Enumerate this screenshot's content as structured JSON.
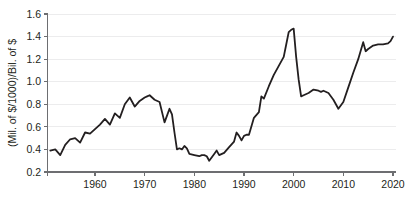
{
  "chart_data": {
    "type": "line",
    "title": "",
    "xlabel": "",
    "ylabel": "(Mil. of $/1000)/Bil. of $",
    "xlim": [
      1951,
      2020
    ],
    "ylim": [
      0.2,
      1.6
    ],
    "grid": true,
    "legend": false,
    "line_color": "#231f20",
    "background_color": "#ffffff",
    "gridline_color": "#ececed",
    "axis_color": "#6d6e71",
    "xticks": [
      "1960",
      "1970",
      "1980",
      "1990",
      "2000",
      "2010",
      "2020"
    ],
    "xtick_values": [
      1960,
      1970,
      1980,
      1990,
      2000,
      2010,
      2020
    ],
    "yticks": [
      "0.2",
      "0.4",
      "0.6",
      "0.8",
      "1.0",
      "1.2",
      "1.4",
      "1.6"
    ],
    "ytick_values": [
      0.2,
      0.4,
      0.6,
      0.8,
      1.0,
      1.2,
      1.4,
      1.6
    ],
    "x": [
      1951,
      1952,
      1953,
      1954,
      1955,
      1956,
      1957,
      1958,
      1959,
      1960,
      1961,
      1962,
      1963,
      1964,
      1965,
      1966,
      1967,
      1968,
      1969,
      1970,
      1971,
      1972,
      1973,
      1974,
      1975,
      1976,
      1977,
      1978,
      1979,
      1980,
      1981,
      1982,
      1983,
      1984,
      1985,
      1986,
      1987,
      1988,
      1989,
      1990,
      1991,
      1992,
      1993,
      1994,
      1995,
      1996,
      1997,
      1998,
      1999,
      2000,
      2001,
      2002,
      2003,
      2004,
      2005,
      2006,
      2007,
      2008,
      2009,
      2010,
      2011,
      2012,
      2013,
      2014,
      2015,
      2016,
      2017,
      2018,
      2019,
      2020
    ],
    "values": [
      0.39,
      0.4,
      0.35,
      0.44,
      0.49,
      0.5,
      0.46,
      0.55,
      0.54,
      0.58,
      0.62,
      0.67,
      0.62,
      0.72,
      0.68,
      0.8,
      0.86,
      0.78,
      0.83,
      0.86,
      0.87,
      0.88,
      0.84,
      0.82,
      0.64,
      0.7,
      0.76,
      0.71,
      0.55,
      0.4,
      0.41,
      0.4,
      0.43,
      0.41,
      0.36,
      0.35,
      0.34,
      0.35,
      0.35,
      0.34,
      0.3,
      0.36,
      0.39,
      0.35,
      0.37,
      0.42,
      0.47,
      0.55,
      0.52,
      0.48,
      0.52,
      0.53,
      0.53,
      0.68,
      0.73,
      0.87,
      0.85,
      0.96,
      1.06,
      1.14,
      1.22,
      1.33,
      1.44,
      1.46,
      1.47,
      1.22,
      1.02,
      0.87,
      0.88,
      0.9
    ],
    "values_tail": [
      0.93,
      0.92,
      0.91,
      0.92,
      0.9,
      0.84,
      0.76,
      0.82,
      0.95,
      1.08,
      1.2,
      1.35,
      1.27,
      1.29,
      1.32,
      1.33,
      1.33,
      1.34,
      1.36,
      1.4
    ],
    "series_points": [
      [
        1951,
        0.39
      ],
      [
        1952,
        0.4
      ],
      [
        1953,
        0.35
      ],
      [
        1954,
        0.44
      ],
      [
        1955,
        0.49
      ],
      [
        1956,
        0.5
      ],
      [
        1957,
        0.46
      ],
      [
        1958,
        0.55
      ],
      [
        1959,
        0.54
      ],
      [
        1960,
        0.58
      ],
      [
        1961,
        0.62
      ],
      [
        1962,
        0.67
      ],
      [
        1963,
        0.62
      ],
      [
        1964,
        0.72
      ],
      [
        1965,
        0.68
      ],
      [
        1966,
        0.8
      ],
      [
        1967,
        0.86
      ],
      [
        1968,
        0.78
      ],
      [
        1969,
        0.83
      ],
      [
        1970,
        0.86
      ],
      [
        1970.5,
        0.87
      ],
      [
        1971,
        0.88
      ],
      [
        1972,
        0.84
      ],
      [
        1973,
        0.82
      ],
      [
        1974,
        0.64
      ],
      [
        1974.5,
        0.7
      ],
      [
        1975,
        0.76
      ],
      [
        1975.5,
        0.71
      ],
      [
        1976,
        0.55
      ],
      [
        1976.5,
        0.4
      ],
      [
        1977,
        0.41
      ],
      [
        1977.5,
        0.4
      ],
      [
        1978,
        0.43
      ],
      [
        1978.5,
        0.41
      ],
      [
        1979,
        0.36
      ],
      [
        1980,
        0.35
      ],
      [
        1981,
        0.34
      ],
      [
        1981.5,
        0.35
      ],
      [
        1982,
        0.35
      ],
      [
        1982.5,
        0.34
      ],
      [
        1983,
        0.3
      ],
      [
        1984,
        0.36
      ],
      [
        1984.5,
        0.39
      ],
      [
        1985,
        0.35
      ],
      [
        1986,
        0.37
      ],
      [
        1987,
        0.42
      ],
      [
        1988,
        0.47
      ],
      [
        1988.5,
        0.55
      ],
      [
        1989,
        0.52
      ],
      [
        1989.5,
        0.48
      ],
      [
        1990,
        0.52
      ],
      [
        1990.5,
        0.53
      ],
      [
        1991,
        0.53
      ],
      [
        1992,
        0.68
      ],
      [
        1993,
        0.73
      ],
      [
        1993.5,
        0.87
      ],
      [
        1994,
        0.85
      ],
      [
        1995,
        0.96
      ],
      [
        1996,
        1.06
      ],
      [
        1997,
        1.14
      ],
      [
        1998,
        1.22
      ],
      [
        1998.5,
        1.33
      ],
      [
        1999,
        1.44
      ],
      [
        1999.5,
        1.46
      ],
      [
        2000,
        1.47
      ],
      [
        2000.5,
        1.22
      ],
      [
        2001,
        1.02
      ],
      [
        2001.5,
        0.87
      ],
      [
        2002,
        0.88
      ],
      [
        2003,
        0.9
      ],
      [
        2004,
        0.93
      ],
      [
        2005,
        0.92
      ],
      [
        2005.5,
        0.91
      ],
      [
        2006,
        0.92
      ],
      [
        2007,
        0.9
      ],
      [
        2008,
        0.84
      ],
      [
        2009,
        0.76
      ],
      [
        2010,
        0.82
      ],
      [
        2011,
        0.95
      ],
      [
        2012,
        1.08
      ],
      [
        2013,
        1.2
      ],
      [
        2014,
        1.35
      ],
      [
        2014.5,
        1.27
      ],
      [
        2015,
        1.29
      ],
      [
        2016,
        1.32
      ],
      [
        2017,
        1.33
      ],
      [
        2018,
        1.33
      ],
      [
        2019,
        1.34
      ],
      [
        2019.5,
        1.36
      ],
      [
        2020,
        1.4
      ]
    ],
    "annotations": {
      "peak_label": "",
      "trough_label": ""
    }
  }
}
